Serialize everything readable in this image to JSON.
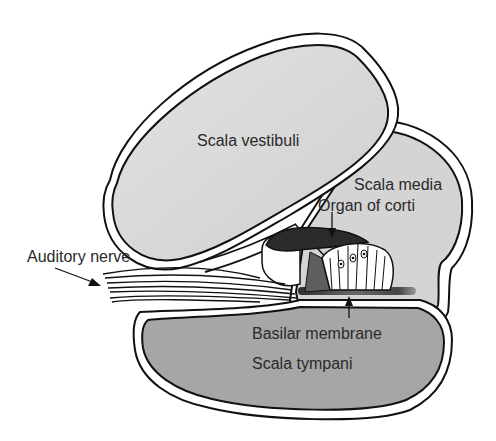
{
  "diagram": {
    "labels": {
      "scala_vestibuli": "Scala vestibuli",
      "scala_media": "Scala media",
      "organ_of_corti": "Organ of corti",
      "auditory_nerve": "Auditory nerve",
      "basilar_membrane": "Basilar membrane",
      "scala_tympani": "Scala tympani"
    },
    "colors": {
      "outline": "#111111",
      "scala_vestibuli_fill": "#d9d9d9",
      "scala_media_fill": "#d4d4d4",
      "scala_tympani_fill": "#a6a6a6",
      "tectorial_membrane": "#2b2b2b",
      "basilar_membrane": "#555555",
      "text": "#2a2a2a"
    }
  }
}
